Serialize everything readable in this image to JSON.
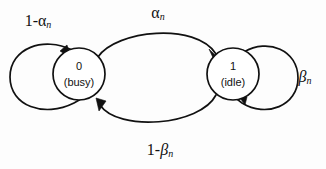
{
  "diagram": {
    "type": "markov-chain-state-diagram",
    "background_color": "#fdfdfd",
    "stroke_color": "#111111",
    "nodes": [
      {
        "id": "state-0",
        "label": "0",
        "sublabel": "(busy)",
        "cx": 79,
        "cy": 74,
        "r": 26
      },
      {
        "id": "state-1",
        "label": "1",
        "sublabel": "(idle)",
        "cx": 233,
        "cy": 74,
        "r": 26
      }
    ],
    "edges": [
      {
        "id": "self-loop-busy",
        "from": "state-0",
        "to": "state-0",
        "label_prefix": "1-",
        "label_greek": "α",
        "label_subscript": "n",
        "label_text": "1-αn",
        "label_x": 38,
        "label_y": 22
      },
      {
        "id": "busy-to-idle",
        "from": "state-0",
        "to": "state-1",
        "label_prefix": "",
        "label_greek": "α",
        "label_subscript": "n",
        "label_text": "αn",
        "label_x": 158,
        "label_y": 14
      },
      {
        "id": "idle-to-busy",
        "from": "state-1",
        "to": "state-0",
        "label_prefix": "1-",
        "label_greek": "β",
        "label_subscript": "n",
        "label_text": "1-βn",
        "label_x": 160,
        "label_y": 151
      },
      {
        "id": "self-loop-idle",
        "from": "state-1",
        "to": "state-1",
        "label_prefix": "",
        "label_greek": "β",
        "label_subscript": "n",
        "label_text": "βn",
        "label_x": 305,
        "label_y": 78
      }
    ]
  }
}
